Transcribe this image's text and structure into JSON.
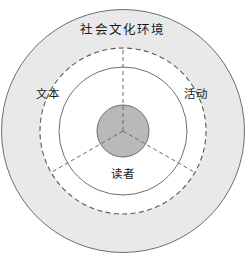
{
  "diagram": {
    "type": "concentric-venn",
    "title_visible": false,
    "background": "#ffffff",
    "center": {
      "x": 123,
      "y": 131
    },
    "rings": [
      {
        "id": "outer",
        "name": "socio-cultural-environment",
        "label": "社会文化环境",
        "radius": 122,
        "fill": "#e9e9e9",
        "stroke": "#6e6e6e",
        "stroke_style": "solid",
        "stroke_width": 1
      },
      {
        "id": "dashed",
        "name": "dashed-boundary",
        "label": "",
        "radius": 83,
        "fill": "#ffffff",
        "stroke": "#5a5a5a",
        "stroke_style": "dashed",
        "stroke_width": 1
      },
      {
        "id": "inner",
        "name": "inner-boundary",
        "label": "",
        "radius": 64,
        "fill": "#ffffff",
        "stroke": "#6e6e6e",
        "stroke_style": "solid",
        "stroke_width": 1
      },
      {
        "id": "core",
        "name": "core-hub",
        "label": "",
        "radius": 26,
        "fill": "#b9b9b9",
        "stroke": "#6e6e6e",
        "stroke_style": "solid",
        "stroke_width": 1
      }
    ],
    "sectors": [
      {
        "id": "text",
        "label": "文本",
        "angle_deg": 150,
        "position": "upper-left"
      },
      {
        "id": "activity",
        "label": "活动",
        "angle_deg": 30,
        "position": "upper-right"
      },
      {
        "id": "reader",
        "label": "读者",
        "angle_deg": 270,
        "position": "bottom"
      }
    ],
    "spokes": [
      {
        "id": "spoke-up",
        "angle_deg": 90,
        "from_radius": 0,
        "to_radius": 83,
        "style": "dashed",
        "color": "#6a6a6a"
      },
      {
        "id": "spoke-lower-left",
        "angle_deg": 210,
        "from_radius": 0,
        "to_radius": 83,
        "style": "dashed",
        "color": "#6a6a6a"
      },
      {
        "id": "spoke-lower-right",
        "angle_deg": 330,
        "from_radius": 0,
        "to_radius": 83,
        "style": "dashed",
        "color": "#6a6a6a"
      }
    ],
    "labels": {
      "outer_ring": "社会文化环境",
      "sector_left": "文本",
      "sector_right": "活动",
      "sector_bottom": "读者"
    },
    "colors": {
      "outer_fill": "#e9e9e9",
      "mid_fill": "#ffffff",
      "core_fill": "#b9b9b9",
      "stroke": "#6e6e6e",
      "dashed_stroke": "#5a5a5a",
      "text": "#1a1a1a"
    }
  }
}
